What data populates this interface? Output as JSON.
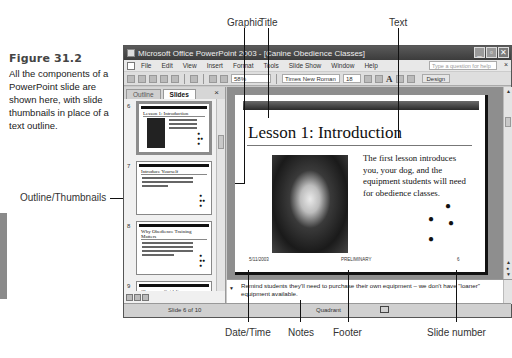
{
  "figure": {
    "title": "Figure 31.2",
    "caption": "All the components of a PowerPoint slide are shown here, with slide thumbnails in place of a text outline."
  },
  "callouts": {
    "graphic": "Graphic",
    "title": "Title",
    "text": "Text",
    "outline_thumbnails": "Outline/Thumbnails",
    "date_time": "Date/Time",
    "notes": "Notes",
    "footer": "Footer",
    "slide_number": "Slide number"
  },
  "window": {
    "title": "Microsoft Office PowerPoint 2003 - [Canine Obedience Classes]",
    "buttons": [
      "_",
      "▫",
      "✕"
    ]
  },
  "menubar": {
    "items": [
      "File",
      "Edit",
      "View",
      "Insert",
      "Format",
      "Tools",
      "Slide Show",
      "Window",
      "Help"
    ],
    "help_placeholder": "Type a question for help",
    "close": "×"
  },
  "toolbar": {
    "zoom": "58%",
    "font": "Times New Roman",
    "size": "18",
    "grow_font": "A",
    "design": "Design"
  },
  "pane": {
    "tabs": [
      "Outline",
      "Slides"
    ],
    "active_tab": "Slides",
    "close": "×",
    "thumbnails": [
      {
        "number": "6",
        "title": "Lesson 1: Introduction",
        "selected": true
      },
      {
        "number": "7",
        "title": "Introduce Yourself",
        "selected": false
      },
      {
        "number": "8",
        "title": "Why Obedience Training Matters",
        "selected": false
      },
      {
        "number": "9",
        "title": "Classroom Guidelines",
        "selected": false
      }
    ]
  },
  "slide": {
    "title": "Lesson 1: Introduction",
    "body": "The first lesson introduces you, your dog, and the equipment students will need for obedience classes.",
    "date": "5/11/2003",
    "footer": "PRELIMINARY",
    "number": "6",
    "paw_glyph": "🐾"
  },
  "notes": {
    "text": "Remind students they'll need to purchase their own equipment – we don't have \"loaner\" equipment available."
  },
  "statusbar": {
    "slide_indicator": "Slide 6 of 10",
    "design": "Quadrant"
  }
}
